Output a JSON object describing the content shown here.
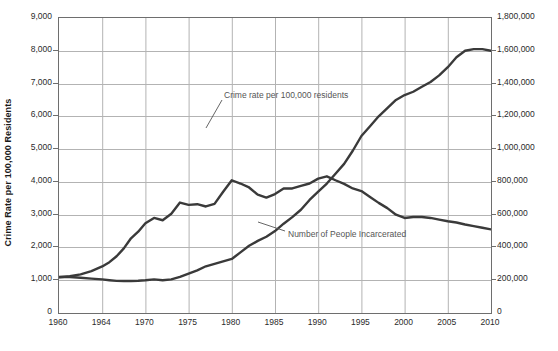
{
  "chart_data": {
    "type": "line",
    "title": "",
    "xlabel": "",
    "ylabel": "Crime Rate per 100,000 Residents",
    "y2label": "Number of People Incarcerated",
    "grid": true,
    "legend": "annotations-inline",
    "xlim": [
      1960,
      2011
    ],
    "ylim": [
      0,
      9000
    ],
    "y2lim": [
      0,
      1800000
    ],
    "xticks": [
      "1960",
      "1964",
      "1970",
      "1975",
      "1980",
      "1985",
      "1990",
      "1995",
      "2000",
      "2005",
      "2010"
    ],
    "xtick_values": [
      1960,
      1964,
      1970,
      1975,
      1980,
      1985,
      1990,
      1995,
      2000,
      2005,
      2010
    ],
    "yticks": [
      "0",
      "1,000",
      "2,000",
      "3,000",
      "4,000",
      "5,000",
      "6,000",
      "7,000",
      "8,000",
      "9,000"
    ],
    "ytick_values": [
      0,
      1000,
      2000,
      3000,
      4000,
      5000,
      6000,
      7000,
      8000,
      9000
    ],
    "y2ticks": [
      "0",
      "200,000",
      "400,000",
      "600,000",
      "800,000",
      "1,000,000",
      "1,200,000",
      "1,400,000",
      "1,600,000",
      "1,800,000"
    ],
    "y2tick_values": [
      0,
      200000,
      400000,
      600000,
      800000,
      1000000,
      1200000,
      1400000,
      1600000,
      1800000
    ],
    "x": [
      1960,
      1961,
      1962,
      1963,
      1964,
      1965,
      1966,
      1967,
      1968,
      1969,
      1970,
      1971,
      1972,
      1973,
      1974,
      1975,
      1976,
      1977,
      1978,
      1979,
      1980,
      1981,
      1982,
      1983,
      1984,
      1985,
      1986,
      1987,
      1988,
      1989,
      1990,
      1991,
      1992,
      1993,
      1994,
      1995,
      1996,
      1997,
      1998,
      1999,
      2000,
      2001,
      2002,
      2003,
      2004,
      2005,
      2006,
      2007,
      2008,
      2009,
      2010,
      2011
    ],
    "series": [
      {
        "name": "Crime rate per 100,000 residents",
        "axis": "left",
        "color": "#3a3a3a",
        "values": [
          1090,
          1120,
          1180,
          1280,
          1420,
          1550,
          1730,
          1970,
          2280,
          2480,
          2740,
          2900,
          2830,
          3030,
          3370,
          3300,
          3320,
          3250,
          3330,
          3700,
          4050,
          3950,
          3830,
          3610,
          3520,
          3630,
          3800,
          3800,
          3880,
          3950,
          4100,
          4170,
          4050,
          3940,
          3800,
          3720,
          3540,
          3360,
          3200,
          3000,
          2900,
          2930,
          2930,
          2900,
          2850,
          2800,
          2760,
          2700,
          2650,
          2600,
          2550,
          2530
        ]
      },
      {
        "name": "Number of People Incarcerated",
        "axis": "right",
        "color": "#3a3a3a",
        "values": [
          220000,
          220000,
          215000,
          210000,
          205000,
          200000,
          196000,
          195000,
          195000,
          197000,
          200000,
          205000,
          200000,
          205000,
          220000,
          240000,
          260000,
          285000,
          300000,
          315000,
          330000,
          370000,
          410000,
          440000,
          465000,
          500000,
          545000,
          585000,
          630000,
          690000,
          740000,
          790000,
          850000,
          910000,
          990000,
          1080000,
          1140000,
          1200000,
          1250000,
          1300000,
          1330000,
          1350000,
          1380000,
          1410000,
          1450000,
          1500000,
          1560000,
          1600000,
          1610000,
          1610000,
          1600000,
          1590000
        ]
      }
    ],
    "annotations": [
      {
        "text": "Crime rate per 100,000 residents",
        "label_x": 224,
        "label_y": 91,
        "leader_from_x": 222,
        "leader_from_y": 100,
        "leader_to_x": 206,
        "leader_to_y": 128
      },
      {
        "text": "Number of People Incarcerated",
        "label_x": 288,
        "label_y": 230,
        "leader_from_x": 285,
        "leader_from_y": 231,
        "leader_to_x": 258,
        "leader_to_y": 222
      }
    ]
  },
  "colors": {
    "line": "#3a3a3a",
    "grid": "#b3b3b3",
    "frame": "#6e6e6e",
    "tick_text": "#2b2b2b",
    "annotation_text": "#555555",
    "background": "#ffffff"
  }
}
